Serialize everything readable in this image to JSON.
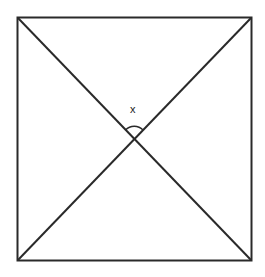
{
  "diagram": {
    "angle_label": "x",
    "stroke_color": "#2a2a2a"
  }
}
